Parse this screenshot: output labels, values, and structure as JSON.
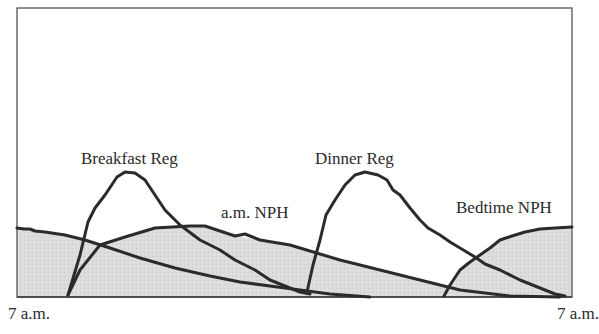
{
  "diagram": {
    "type": "insulin action profile",
    "curves": [
      {
        "id": "breakfast_reg",
        "label": "Breakfast Reg",
        "shape": "peaked (rapid rise, short duration)"
      },
      {
        "id": "am_nph",
        "label": "a.m. NPH",
        "shape": "broad intermediate-acting"
      },
      {
        "id": "dinner_reg",
        "label": "Dinner Reg",
        "shape": "peaked (rapid rise, short duration)"
      },
      {
        "id": "bedtime_nph",
        "label": "Bedtime NPH",
        "shape": "broad intermediate-acting, continues into next morning"
      }
    ],
    "shaded_region": "basal NPH coverage (gray fill)",
    "x_axis": {
      "start_label": "7 a.m.",
      "end_label": "7 a.m."
    },
    "colors": {
      "line": "#2b2b2b",
      "fill": "#d9d9d9",
      "frame": "#555555",
      "background": "#ffffff"
    }
  },
  "labels": {
    "breakfast_reg": "Breakfast Reg",
    "am_nph": "a.m. NPH",
    "dinner_reg": "Dinner Reg",
    "bedtime_nph": "Bedtime NPH",
    "x_start": "7 a.m.",
    "x_end": "7 a.m."
  }
}
